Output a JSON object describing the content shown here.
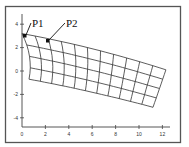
{
  "figure": {
    "annotations": [
      {
        "label": "P1",
        "text_x": 32,
        "text_y": 27,
        "target_x": 25,
        "target_y": 36
      },
      {
        "label": "P2",
        "text_x": 66,
        "text_y": 27,
        "target_x": 48,
        "target_y": 41
      }
    ]
  },
  "chart_data": {
    "type": "diagram",
    "title": "",
    "xlabel": "",
    "ylabel": "",
    "x_ticks": [
      "0",
      "2",
      "4",
      "6",
      "8",
      "10",
      "12"
    ],
    "y_ticks": [
      "4",
      "2",
      "0",
      "-2",
      "-4"
    ],
    "xlim": [
      0,
      12.5
    ],
    "ylim": [
      -4.5,
      4.5
    ],
    "grid": false,
    "mesh": {
      "description": "Deformed quadrilateral mesh tilted downward to the right",
      "columns": 11,
      "rows": 4,
      "corners": {
        "top_left": [
          0,
          3.2
        ],
        "top_right": [
          12.3,
          0.1
        ],
        "bottom_left": [
          0.6,
          -0.7
        ],
        "bottom_right": [
          11.2,
          -3.1
        ]
      }
    },
    "labeled_points": [
      {
        "label": "P1",
        "x": 0.3,
        "y": 2.9
      },
      {
        "label": "P2",
        "x": 2.2,
        "y": 2.5
      }
    ]
  }
}
